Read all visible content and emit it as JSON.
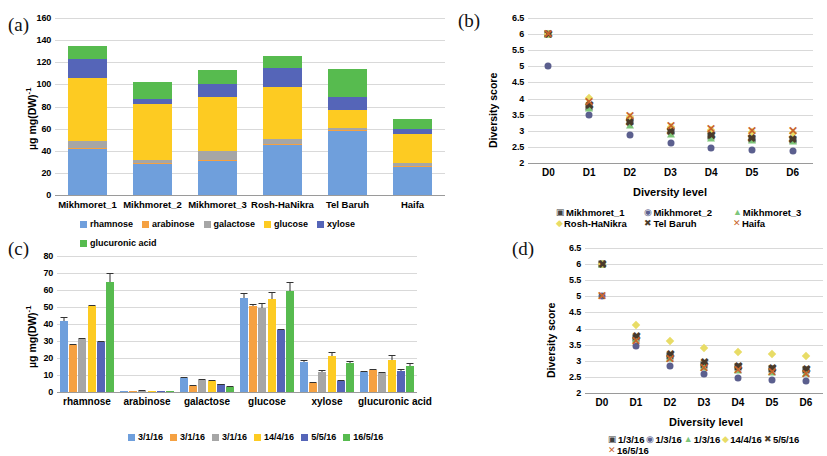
{
  "figure": {
    "panels": [
      "(a)",
      "(b)",
      "(c)",
      "(d)"
    ]
  },
  "panel_a": {
    "tag": "(a)",
    "ylabel_main": "µg mg(DW)",
    "ylabel_sup": "-1",
    "yticks": [
      "0",
      "20",
      "40",
      "60",
      "80",
      "100",
      "120",
      "140",
      "160"
    ],
    "categories": [
      "Mikhmoret_1",
      "Mikhmoret_2",
      "Mikhmoret_3",
      "Rosh-HaNikra",
      "Tel Baruh",
      "Haifa"
    ],
    "legend": [
      "rhamnose",
      "arabinose",
      "galactose",
      "glucose",
      "xylose",
      "glucuronic acid"
    ]
  },
  "panel_b": {
    "tag": "(b)",
    "ylabel": "Diversity score",
    "xlabel": "Diversity level",
    "yticks": [
      "2",
      "2.5",
      "3",
      "3.5",
      "4",
      "4.5",
      "5",
      "5.5",
      "6",
      "6.5"
    ],
    "xticks": [
      "D0",
      "D1",
      "D2",
      "D3",
      "D4",
      "D5",
      "D6"
    ],
    "legend": [
      "Mikhmoret_1",
      "Mikhmoret_2",
      "Mikhmoret_3",
      "Rosh-HaNikra",
      "Tel Baruh",
      "Haifa"
    ]
  },
  "panel_c": {
    "tag": "(c)",
    "ylabel_main": "µg mg(DW)",
    "ylabel_sup": "-1",
    "yticks": [
      "0",
      "10",
      "20",
      "30",
      "40",
      "50",
      "60",
      "70",
      "80"
    ],
    "categories": [
      "rhamnose",
      "arabinose",
      "galactose",
      "glucose",
      "xylose",
      "glucuronic acid"
    ],
    "legend": [
      "3/1/16",
      "3/1/16",
      "3/1/16",
      "14/4/16",
      "5/5/16",
      "16/5/16"
    ]
  },
  "panel_d": {
    "tag": "(d)",
    "ylabel": "Diversity score",
    "xlabel": "Diversity level",
    "yticks": [
      "2",
      "2.5",
      "3",
      "3.5",
      "4",
      "4.5",
      "5",
      "5.5",
      "6",
      "6.5"
    ],
    "xticks": [
      "D0",
      "D1",
      "D2",
      "D3",
      "D4",
      "D5",
      "D6"
    ],
    "legend": [
      "1/3/16",
      "1/3/16",
      "1/3/16",
      "14/4/16",
      "5/5/16",
      "16/5/16"
    ]
  },
  "colors": {
    "rhamnose": "#6f9fdc",
    "arabinose": "#f5a142",
    "galactose": "#a6a6a6",
    "glucose": "#fdcb22",
    "xylose": "#5565b8",
    "glucuronic_acid": "#57bb4f",
    "grid": "#d9d9d9",
    "axis": "#9a9a9a"
  },
  "chart_data": [
    {
      "panel": "a",
      "type": "bar",
      "stacked": true,
      "title": "",
      "xlabel": "",
      "ylabel": "µg mg(DW)-1",
      "ylim": [
        0,
        160
      ],
      "ytick_step": 20,
      "grid": true,
      "legend_position": "bottom",
      "categories": [
        "Mikhmoret_1",
        "Mikhmoret_2",
        "Mikhmoret_3",
        "Rosh-HaNikra",
        "Tel Baruh",
        "Haifa"
      ],
      "series": [
        {
          "name": "rhamnose",
          "color": "#6f9fdc",
          "values": [
            42.0,
            28.0,
            31.0,
            46.0,
            58.0,
            26.0
          ]
        },
        {
          "name": "arabinose",
          "color": "#f5a142",
          "values": [
            0.6,
            0.5,
            0.4,
            0.5,
            0.5,
            0.4
          ]
        },
        {
          "name": "galactose",
          "color": "#a6a6a6",
          "values": [
            6.4,
            3.5,
            8.6,
            4.5,
            2.5,
            2.6
          ]
        },
        {
          "name": "glucose",
          "color": "#fdcb22",
          "values": [
            57.0,
            50.0,
            49.0,
            47.0,
            16.0,
            26.0
          ]
        },
        {
          "name": "xylose",
          "color": "#5565b8",
          "values": [
            17.0,
            5.0,
            11.0,
            17.0,
            12.0,
            5.0
          ]
        },
        {
          "name": "glucuronic acid",
          "color": "#57bb4f",
          "values": [
            12.0,
            15.0,
            13.0,
            11.0,
            25.0,
            9.0
          ]
        }
      ],
      "totals": [
        135.0,
        102.0,
        113.0,
        126.0,
        114.0,
        69.0
      ]
    },
    {
      "panel": "b",
      "type": "scatter",
      "title": "",
      "xlabel": "Diversity level",
      "ylabel": "Diversity score",
      "ylim": [
        2,
        6.5
      ],
      "ytick_step": 0.5,
      "grid": true,
      "legend_position": "bottom",
      "x": [
        "D0",
        "D1",
        "D2",
        "D3",
        "D4",
        "D5",
        "D6"
      ],
      "series": [
        {
          "name": "Mikhmoret_1",
          "marker": "square",
          "color": "#3f3f3f",
          "values": [
            6.0,
            3.75,
            3.3,
            3.0,
            2.85,
            2.75,
            2.7
          ]
        },
        {
          "name": "Mikhmoret_2",
          "marker": "circle",
          "color": "#5b5f8e",
          "values": [
            5.0,
            3.48,
            2.88,
            2.62,
            2.48,
            2.42,
            2.38
          ]
        },
        {
          "name": "Mikhmoret_3",
          "marker": "triangle",
          "color": "#7ec67a",
          "values": [
            6.0,
            3.7,
            3.18,
            2.9,
            2.78,
            2.72,
            2.68
          ]
        },
        {
          "name": "Rosh-HaNikra",
          "marker": "diamond",
          "color": "#e8dc66",
          "values": [
            6.0,
            4.02,
            3.42,
            3.12,
            3.02,
            2.95,
            2.92
          ]
        },
        {
          "name": "Tel Baruh",
          "marker": "x-bold",
          "color": "#4a3a2a",
          "values": [
            6.0,
            3.8,
            3.28,
            2.98,
            2.86,
            2.78,
            2.74
          ]
        },
        {
          "name": "Haifa",
          "marker": "x-thin",
          "color": "#c8652c",
          "values": [
            6.0,
            3.88,
            3.45,
            3.15,
            3.05,
            3.0,
            2.98
          ]
        }
      ]
    },
    {
      "panel": "c",
      "type": "bar",
      "stacked": false,
      "title": "",
      "xlabel": "",
      "ylabel": "µg mg(DW)-1",
      "ylim": [
        0,
        80
      ],
      "ytick_step": 10,
      "grid": true,
      "legend_position": "bottom",
      "categories": [
        "rhamnose",
        "arabinose",
        "galactose",
        "glucose",
        "xylose",
        "glucuronic acid"
      ],
      "series": [
        {
          "name": "3/1/16",
          "color": "#6f9fdc",
          "values": [
            41.5,
            0.3,
            8.0,
            55.5,
            17.5,
            11.5
          ],
          "errors": [
            2.5,
            0.2,
            0.8,
            2.5,
            1.2,
            1.0
          ]
        },
        {
          "name": "3/1/16",
          "color": "#f5a142",
          "values": [
            27.5,
            0.3,
            3.5,
            50.5,
            5.5,
            13.0
          ],
          "errors": [
            0.8,
            0.2,
            0.5,
            1.0,
            0.5,
            0.8
          ]
        },
        {
          "name": "3/1/16",
          "color": "#a6a6a6",
          "values": [
            31.0,
            0.8,
            7.0,
            49.5,
            11.5,
            11.0
          ],
          "errors": [
            0.8,
            0.3,
            0.8,
            3.0,
            1.2,
            0.8
          ]
        },
        {
          "name": "14/4/16",
          "color": "#fdcb22",
          "values": [
            50.5,
            0.5,
            6.5,
            55.0,
            21.0,
            19.0
          ],
          "errors": [
            0.8,
            0.2,
            0.5,
            4.0,
            2.5,
            3.0
          ]
        },
        {
          "name": "5/5/16",
          "color": "#5565b8",
          "values": [
            29.5,
            0.3,
            4.5,
            36.5,
            6.5,
            12.5
          ],
          "errors": [
            0.8,
            0.2,
            0.5,
            0.8,
            0.8,
            0.8
          ]
        },
        {
          "name": "16/5/16",
          "color": "#57bb4f",
          "values": [
            64.5,
            0.3,
            2.8,
            59.5,
            17.0,
            15.5
          ],
          "errors": [
            5.5,
            0.2,
            0.5,
            5.5,
            1.5,
            1.5
          ]
        }
      ]
    },
    {
      "panel": "d",
      "type": "scatter",
      "title": "",
      "xlabel": "Diversity level",
      "ylabel": "Diversity score",
      "ylim": [
        2,
        6.5
      ],
      "ytick_step": 0.5,
      "grid": true,
      "legend_position": "bottom",
      "x": [
        "D0",
        "D1",
        "D2",
        "D3",
        "D4",
        "D5",
        "D6"
      ],
      "series": [
        {
          "name": "1/3/16",
          "marker": "square",
          "color": "#3f3f3f",
          "values": [
            6.0,
            3.72,
            3.15,
            2.88,
            2.8,
            2.74,
            2.7
          ]
        },
        {
          "name": "1/3/16",
          "marker": "circle",
          "color": "#5b5f8e",
          "values": [
            5.0,
            3.45,
            2.85,
            2.58,
            2.48,
            2.4,
            2.36
          ]
        },
        {
          "name": "1/3/16",
          "marker": "triangle",
          "color": "#7ec67a",
          "values": [
            6.0,
            3.68,
            3.08,
            2.8,
            2.72,
            2.66,
            2.62
          ]
        },
        {
          "name": "14/4/16",
          "marker": "diamond",
          "color": "#e8dc66",
          "values": [
            6.0,
            4.1,
            3.62,
            3.4,
            3.28,
            3.2,
            3.15
          ]
        },
        {
          "name": "5/5/16",
          "marker": "x-bold",
          "color": "#4a3a2a",
          "values": [
            6.0,
            3.78,
            3.22,
            2.95,
            2.85,
            2.78,
            2.74
          ]
        },
        {
          "name": "16/5/16",
          "marker": "x-thin",
          "color": "#c8652c",
          "values": [
            5.0,
            3.6,
            3.05,
            2.78,
            2.7,
            2.64,
            2.6
          ]
        }
      ]
    }
  ]
}
